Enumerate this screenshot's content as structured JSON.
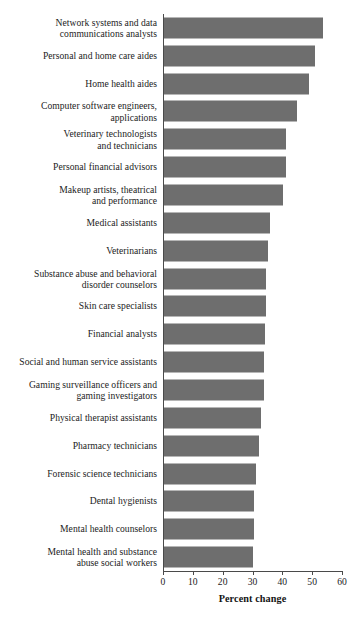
{
  "chart_data": {
    "type": "bar",
    "orientation": "horizontal",
    "title": "",
    "xlabel": "Percent change",
    "ylabel": "",
    "xlim": [
      0,
      60
    ],
    "xticks": [
      0,
      10,
      20,
      30,
      40,
      50,
      60
    ],
    "grid": false,
    "legend": null,
    "bar_color": "#6e6e6e",
    "axis_color": "#4a4a4a",
    "categories": [
      "Network systems and data\ncommunications analysts",
      "Personal and home care aides",
      "Home health aides",
      "Computer software engineers,\napplications",
      "Veterinary technologists\nand technicians",
      "Personal financial advisors",
      "Makeup artists, theatrical\nand performance",
      "Medical assistants",
      "Veterinarians",
      "Substance abuse and behavioral\ndisorder counselors",
      "Skin care specialists",
      "Financial analysts",
      "Social and human service assistants",
      "Gaming surveillance officers and\ngaming investigators",
      "Physical therapist assistants",
      "Pharmacy technicians",
      "Forensic science technicians",
      "Dental hygienists",
      "Mental health counselors",
      "Mental health and substance\nabuse social workers"
    ],
    "values": [
      53.4,
      50.6,
      48.7,
      44.6,
      41,
      41,
      39.8,
      35.4,
      35,
      34.3,
      34.3,
      33.8,
      33.6,
      33.6,
      32.4,
      32,
      30.7,
      30.1,
      30,
      29.9
    ]
  }
}
